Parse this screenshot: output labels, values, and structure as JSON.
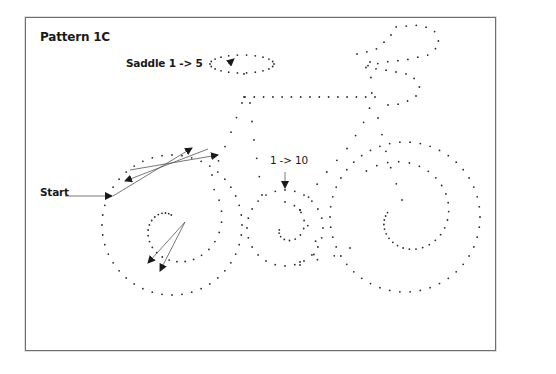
{
  "title": "Pattern 1C",
  "labels": {
    "saddle": "Saddle 1 -> 5",
    "start": "Start",
    "center": "1 -> 10"
  },
  "colors": {
    "dot": "#2a2a2a",
    "arrow": "#1a1a1a",
    "line": "#555555",
    "frame": "#6e6e6e"
  },
  "pattern": {
    "saddle": {
      "type": "ellipse",
      "cx": 242,
      "cy": 64,
      "rx": 32,
      "ry": 9,
      "n": 22
    },
    "front_outer": {
      "type": "circle",
      "cx": 172,
      "cy": 225,
      "r": 70,
      "n": 44
    },
    "front_inner_spiral": {
      "type": "spiral",
      "cx": 172,
      "cy": 225,
      "r0": 55,
      "r1": 10,
      "turns": 0.85,
      "start_deg": -40,
      "n": 26
    },
    "rear_outer": {
      "type": "circle",
      "cx": 405,
      "cy": 217,
      "r": 75,
      "n": 46
    },
    "rear_inner": {
      "type": "spiral",
      "cx": 405,
      "cy": 217,
      "r0": 60,
      "r1": 18,
      "turns": 0.9,
      "start_deg": -130,
      "n": 30
    },
    "chainring": {
      "type": "circle",
      "cx": 285,
      "cy": 228,
      "r": 38,
      "n": 24
    },
    "chainring_inner": {
      "type": "spiral",
      "cx": 285,
      "cy": 228,
      "r0": 26,
      "r1": 6,
      "turns": 0.7,
      "start_deg": -90,
      "n": 12
    },
    "top_tube": {
      "type": "line",
      "points": [
        [
          245,
          97
        ],
        [
          375,
          97
        ]
      ],
      "n": 15
    },
    "seat_post": {
      "type": "line",
      "points": [
        [
          244,
          74
        ],
        [
          244,
          97
        ]
      ],
      "n": 2
    },
    "seat_tube_left": {
      "type": "line",
      "points": [
        [
          242,
          103
        ],
        [
          228,
          140
        ],
        [
          212,
          175
        ]
      ],
      "n": 6
    },
    "seat_tube_right": {
      "type": "line",
      "points": [
        [
          250,
          103
        ],
        [
          254,
          140
        ],
        [
          262,
          195
        ]
      ],
      "n": 6
    },
    "head_tube": {
      "type": "line",
      "points": [
        [
          370,
          62
        ],
        [
          372,
          97
        ],
        [
          368,
          115
        ],
        [
          350,
          145
        ],
        [
          320,
          180
        ],
        [
          300,
          210
        ]
      ],
      "n": 12
    },
    "down_tube": {
      "type": "line",
      "points": [
        [
          378,
          118
        ],
        [
          388,
          160
        ],
        [
          402,
          200
        ]
      ],
      "n": 6
    },
    "chainstay": {
      "type": "line",
      "points": [
        [
          300,
          262
        ],
        [
          330,
          258
        ],
        [
          350,
          248
        ]
      ],
      "n": 4
    },
    "handlebar": {
      "type": "line",
      "points": [
        [
          357,
          54
        ],
        [
          375,
          50
        ],
        [
          390,
          37
        ],
        [
          395,
          27
        ],
        [
          420,
          25
        ],
        [
          434,
          30
        ],
        [
          440,
          45
        ],
        [
          428,
          55
        ],
        [
          405,
          60
        ],
        [
          385,
          62
        ],
        [
          362,
          67
        ],
        [
          385,
          70
        ],
        [
          412,
          75
        ],
        [
          420,
          88
        ],
        [
          415,
          98
        ],
        [
          400,
          104
        ],
        [
          388,
          105
        ]
      ],
      "n": 30
    },
    "rear_stay": {
      "type": "line",
      "points": [
        [
          300,
          210
        ],
        [
          320,
          250
        ],
        [
          300,
          265
        ]
      ],
      "n": 5
    }
  },
  "arrows": [
    {
      "from": [
        65,
        196
      ],
      "to": [
        112,
        196
      ]
    },
    {
      "from": [
        113,
        196
      ],
      "to": [
        192,
        148
      ]
    },
    {
      "from": [
        208,
        149
      ],
      "to": [
        125,
        181
      ]
    },
    {
      "from": [
        130,
        170
      ],
      "to": [
        218,
        155
      ]
    },
    {
      "from": [
        185,
        222
      ],
      "to": [
        148,
        263
      ]
    },
    {
      "from": [
        185,
        222
      ],
      "to": [
        160,
        271
      ]
    },
    {
      "from": [
        285,
        172
      ],
      "to": [
        285,
        188
      ]
    },
    {
      "from": [
        228,
        64
      ],
      "to": [
        234,
        59
      ]
    }
  ]
}
